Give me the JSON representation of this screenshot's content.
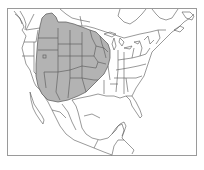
{
  "map": {
    "title": "Range map of North America",
    "region": "North America",
    "highlighted_range": "Interior western/central United States (Great Plains and Rocky Mountain region) extending into southern Canada and northern Mexico",
    "colors": {
      "background": "#ffffff",
      "frame": "#9a9a9a",
      "land": "#ffffff",
      "boundary_lines": "#555555",
      "range_fill": "#b3b3b3",
      "range_outline": "#555555"
    },
    "frame": {
      "x": 7,
      "y": 8,
      "width": 190,
      "height": 148
    }
  }
}
